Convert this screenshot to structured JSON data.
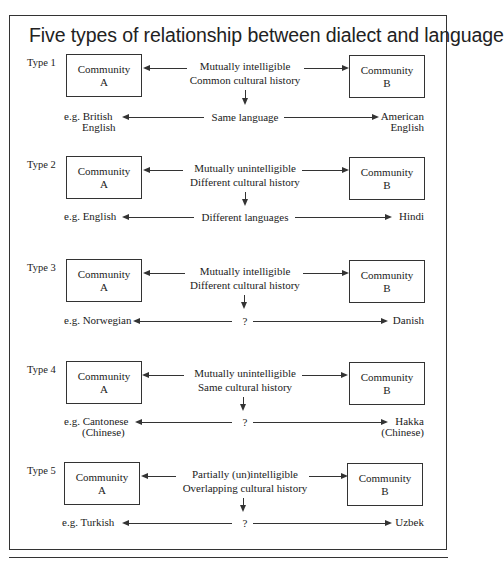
{
  "title": "Five types of relationship between dialect and language",
  "community_a": {
    "line1": "Community",
    "line2": "A"
  },
  "community_b": {
    "line1": "Community",
    "line2": "B"
  },
  "types": [
    {
      "label": "Type 1",
      "relation1": "Mutually intelligible",
      "relation2": "Common cultural history",
      "result": "Same language",
      "example_left_1": "e.g. British",
      "example_left_2": "English",
      "example_right_1": "American",
      "example_right_2": "English"
    },
    {
      "label": "Type 2",
      "relation1": "Mutually unintelligible",
      "relation2": "Different cultural history",
      "result": "Different languages",
      "example_left_1": "e.g. English",
      "example_left_2": "",
      "example_right_1": "Hindi",
      "example_right_2": ""
    },
    {
      "label": "Type 3",
      "relation1": "Mutually intelligible",
      "relation2": "Different cultural history",
      "result": "?",
      "example_left_1": "e.g. Norwegian",
      "example_left_2": "",
      "example_right_1": "Danish",
      "example_right_2": ""
    },
    {
      "label": "Type 4",
      "relation1": "Mutually unintelligible",
      "relation2": "Same cultural history",
      "result": "?",
      "example_left_1": "e.g. Cantonese",
      "example_left_2": "(Chinese)",
      "example_right_1": "Hakka",
      "example_right_2": "(Chinese)"
    },
    {
      "label": "Type 5",
      "relation1": "Partially (un)intelligible",
      "relation2": "Overlapping cultural history",
      "result": "?",
      "example_left_1": "e.g. Turkish",
      "example_left_2": "",
      "example_right_1": "Uzbek",
      "example_right_2": ""
    }
  ]
}
